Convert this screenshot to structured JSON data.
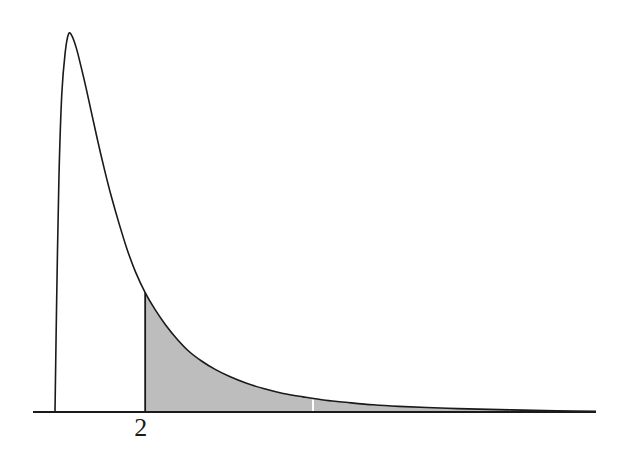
{
  "figure": {
    "title": "",
    "subtitle": "",
    "background_color": "#ffffff"
  },
  "axis": {
    "x_axis_label": "",
    "y_axis_label": "",
    "x_tick_labels": [
      "2"
    ],
    "axis_color": "#1a1a1a",
    "show_y_axis": false,
    "show_grid": false
  },
  "curve": {
    "stroke_color": "#1a1a1a",
    "stroke_width": 1.6,
    "fill_color": "#bdbdbd",
    "shade_start_label": "2",
    "divider_color": "#ffffff"
  },
  "chart_data": {
    "type": "area",
    "title": "",
    "subtitle": "",
    "xlabel": "",
    "ylabel": "",
    "xlim": [
      0,
      10
    ],
    "ylim": [
      0,
      1
    ],
    "grid": false,
    "legend": null,
    "x_tick_values": [
      2
    ],
    "x_tick_labels": [
      "2"
    ],
    "shaded_region": {
      "from": 2,
      "to": 10,
      "fill": "#bdbdbd",
      "label": "2"
    },
    "annotations": [
      {
        "text": "2",
        "x": 2,
        "y": 0,
        "position": "below-axis"
      }
    ],
    "series": [
      {
        "name": "density",
        "x": [
          0.4,
          0.43,
          0.47,
          0.52,
          0.58,
          0.64,
          0.7,
          0.78,
          0.86,
          0.95,
          1.05,
          1.16,
          1.28,
          1.4,
          1.54,
          1.68,
          1.83,
          2.0,
          2.18,
          2.36,
          2.56,
          2.78,
          3.0,
          3.25,
          3.5,
          3.8,
          4.1,
          4.45,
          4.8,
          5.2,
          5.6,
          6.05,
          6.5,
          7.0,
          7.55,
          8.1,
          8.7,
          9.3,
          10.0
        ],
        "y": [
          0.0,
          0.3,
          0.62,
          0.84,
          0.95,
          1.0,
          0.995,
          0.962,
          0.915,
          0.858,
          0.79,
          0.716,
          0.64,
          0.57,
          0.497,
          0.43,
          0.37,
          0.316,
          0.27,
          0.231,
          0.194,
          0.16,
          0.135,
          0.112,
          0.094,
          0.076,
          0.062,
          0.049,
          0.04,
          0.031,
          0.025,
          0.019,
          0.015,
          0.012,
          0.009,
          0.007,
          0.005,
          0.003,
          0.002
        ]
      }
    ]
  },
  "geometry": {
    "baseline_y": 412,
    "axis_x_start": 33,
    "axis_x_end": 596,
    "curve_left_x": 55,
    "peak_x": 77,
    "peak_y": 34,
    "shade_boundary_x": 228,
    "divider_x": 313,
    "shade_end_x": 572
  }
}
